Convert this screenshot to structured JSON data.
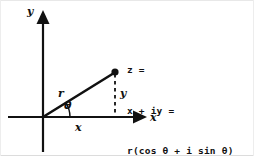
{
  "figure": {
    "background_color": "#ffffff",
    "ink_color": "#111111",
    "width": 254,
    "height": 156
  },
  "axes": {
    "y_axis_label": "y",
    "x_axis_label": "x",
    "origin": {
      "x": 43,
      "y": 117
    },
    "x_axis": {
      "start_x": 8,
      "end_x": 145,
      "y": 117,
      "arrow": "right"
    },
    "y_axis": {
      "x": 43,
      "start_y": 152,
      "end_y": 10,
      "arrow": "up"
    }
  },
  "vector": {
    "magnitude_label": "r",
    "angle_label": "θ",
    "tip": {
      "x": 115,
      "y": 72
    },
    "point_marker": "filled-dot"
  },
  "components": {
    "horizontal_label": "x",
    "vertical_label": "y",
    "drop_line_style": "dashed"
  },
  "equation": {
    "lines": [
      "z =",
      "x + iy =",
      "r(cos θ + i sin θ)"
    ],
    "line1": "z =",
    "line2": "x + iy =",
    "line3": "r(cos θ + i sin θ)"
  }
}
